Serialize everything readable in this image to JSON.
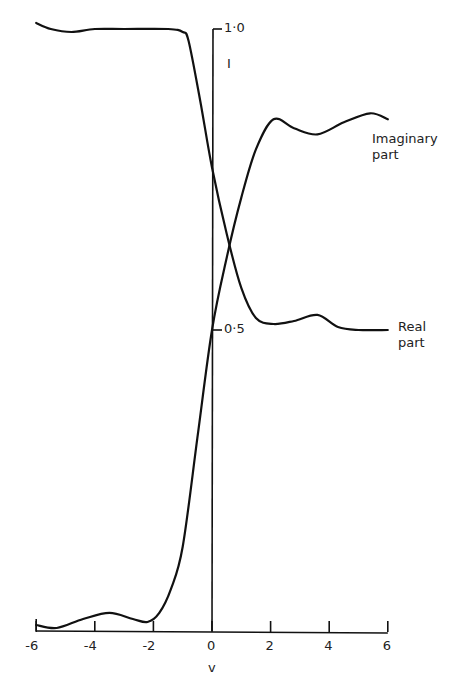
{
  "chart_data": {
    "type": "line",
    "title": "",
    "xlabel": "v",
    "ylabel": "I",
    "xlim": [
      -6,
      6
    ],
    "ylim": [
      0,
      1.0
    ],
    "x_ticks": [
      "-6",
      "-4",
      "-2",
      "0",
      "2",
      "4",
      "6"
    ],
    "y_ticks": [
      "0·5",
      "1·0"
    ],
    "grid": false,
    "legend": "inline labels at right",
    "series": [
      {
        "name": "Imaginary part",
        "points": [
          [
            -6,
            0.01
          ],
          [
            -5.3,
            0.005
          ],
          [
            -4.4,
            0.02
          ],
          [
            -3.5,
            0.03
          ],
          [
            -2.7,
            0.02
          ],
          [
            -2.2,
            0.015
          ],
          [
            -1.8,
            0.03
          ],
          [
            -1.4,
            0.07
          ],
          [
            -1.0,
            0.14
          ],
          [
            -0.5,
            0.32
          ],
          [
            0,
            0.5
          ],
          [
            0.5,
            0.62
          ],
          [
            1.0,
            0.72
          ],
          [
            1.5,
            0.8
          ],
          [
            2.1,
            0.85
          ],
          [
            2.8,
            0.835
          ],
          [
            3.6,
            0.825
          ],
          [
            4.5,
            0.845
          ],
          [
            5.4,
            0.86
          ],
          [
            6,
            0.85
          ]
        ]
      },
      {
        "name": "Real part",
        "points": [
          [
            -6,
            1.01
          ],
          [
            -5.5,
            1.0
          ],
          [
            -4.8,
            0.995
          ],
          [
            -4,
            1.0
          ],
          [
            -3,
            1.0
          ],
          [
            -1.5,
            1.0
          ],
          [
            -1,
            0.995
          ],
          [
            -0.8,
            0.98
          ],
          [
            -0.4,
            0.88
          ],
          [
            0,
            0.77
          ],
          [
            0.5,
            0.66
          ],
          [
            1.0,
            0.57
          ],
          [
            1.5,
            0.52
          ],
          [
            2.1,
            0.51
          ],
          [
            2.8,
            0.515
          ],
          [
            3.6,
            0.525
          ],
          [
            4.3,
            0.505
          ],
          [
            5,
            0.5
          ],
          [
            6,
            0.5
          ]
        ]
      }
    ]
  },
  "labels": {
    "x_axis": "v",
    "y_axis": "I",
    "imaginary_line1": "Imaginary",
    "imaginary_line2": "part",
    "real_line1": "Real",
    "real_line2": "part"
  }
}
